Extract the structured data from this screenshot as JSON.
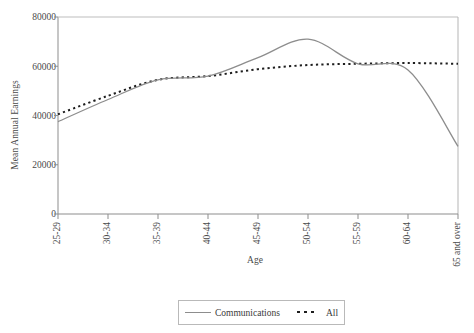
{
  "axes": {
    "ylabel": "Mean Annual Earnings",
    "xlabel": "Age",
    "yticks": [
      "0",
      "20000",
      "40000",
      "60000",
      "80000"
    ],
    "xticks": [
      "25-29",
      "30-34",
      "35-39",
      "40-44",
      "45-49",
      "50-54",
      "55-59",
      "60-64",
      "65 and over"
    ]
  },
  "legend": {
    "items": [
      {
        "label": "Communications",
        "style": "solid",
        "color": "#8d8d8d"
      },
      {
        "label": "All",
        "style": "dotted",
        "color": "#1e1e1e"
      }
    ]
  },
  "colors": {
    "communications": "#8d8d8d",
    "all": "#1e1e1e",
    "axis": "#8d8d8d",
    "text": "#3a3a3a",
    "background": "#ffffff"
  },
  "chart_data": {
    "type": "line",
    "title": "",
    "xlabel": "Age",
    "ylabel": "Mean Annual Earnings",
    "categories": [
      "25-29",
      "30-34",
      "35-39",
      "40-44",
      "45-49",
      "50-54",
      "55-59",
      "60-64",
      "65 and over"
    ],
    "ylim": [
      0,
      80000
    ],
    "yticks": [
      0,
      20000,
      40000,
      60000,
      80000
    ],
    "grid": false,
    "legend_position": "bottom-center",
    "smoothing": "spline",
    "series": [
      {
        "name": "Communications",
        "style": "solid",
        "color": "#8d8d8d",
        "values": [
          37500,
          46500,
          54500,
          56000,
          63500,
          71000,
          61000,
          58500,
          27500
        ]
      },
      {
        "name": "All",
        "style": "dotted",
        "color": "#1e1e1e",
        "values": [
          40500,
          48000,
          54500,
          56000,
          58800,
          60500,
          61000,
          61300,
          61000
        ]
      }
    ]
  }
}
